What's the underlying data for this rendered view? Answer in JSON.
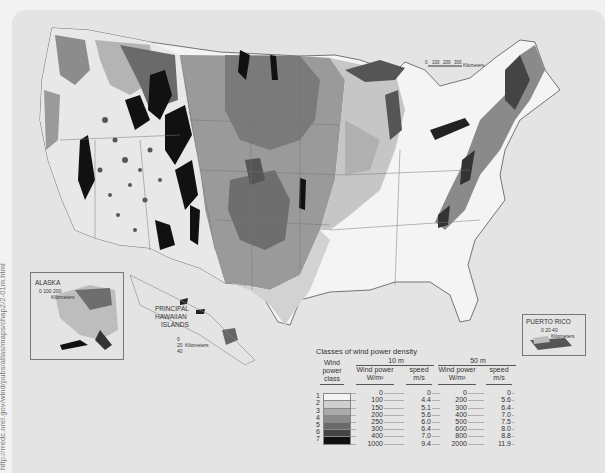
{
  "source_url": "http://rredc.nrel.gov/wind/pubs/atlas/maps/chap2/2-01m.html",
  "map": {
    "subject": "United States wind power density classes",
    "scale_bar": {
      "ticks": [
        "0",
        "100",
        "200",
        "300"
      ],
      "unit": "Kilometers"
    }
  },
  "insets": {
    "alaska": {
      "title": "ALASKA",
      "scale": "0 100 200",
      "unit": "Kilometers"
    },
    "hawaii": {
      "title_lines": [
        "PRINCIPAL",
        "HAWAIIAN",
        "ISLANDS"
      ],
      "scale": "0 20 40",
      "unit": "Kilometers"
    },
    "puerto_rico": {
      "title": "PUERTO RICO",
      "scale": "0 20 40",
      "unit": "Kilometers"
    }
  },
  "legend": {
    "title": "Classes of wind power density",
    "col_class": [
      "Wind",
      "power",
      "class"
    ],
    "height_10": "10 m",
    "height_50": "50 m",
    "wp_label": "Wind power",
    "wp_unit": "W/m²",
    "sp_label": "speed",
    "sp_unit": "m/s",
    "classes": [
      "1",
      "2",
      "3",
      "4",
      "5",
      "6",
      "7"
    ],
    "colors": [
      "#f4f4f4",
      "#cfcfcf",
      "#aaaaaa",
      "#8a8a8a",
      "#6a6a6a",
      "#444444",
      "#111111"
    ],
    "wp10": [
      "0",
      "100",
      "150",
      "200",
      "250",
      "300",
      "400",
      "1000"
    ],
    "sp10": [
      "0",
      "4.4",
      "5.1",
      "5.6",
      "6.0",
      "6.4",
      "7.0",
      "9.4"
    ],
    "wp50": [
      "0",
      "200",
      "300",
      "400",
      "500",
      "600",
      "800",
      "2000"
    ],
    "sp50": [
      "0",
      "5.6",
      "6.4",
      "7.0",
      "7.5",
      "8.0",
      "8.8",
      "11.9"
    ]
  }
}
